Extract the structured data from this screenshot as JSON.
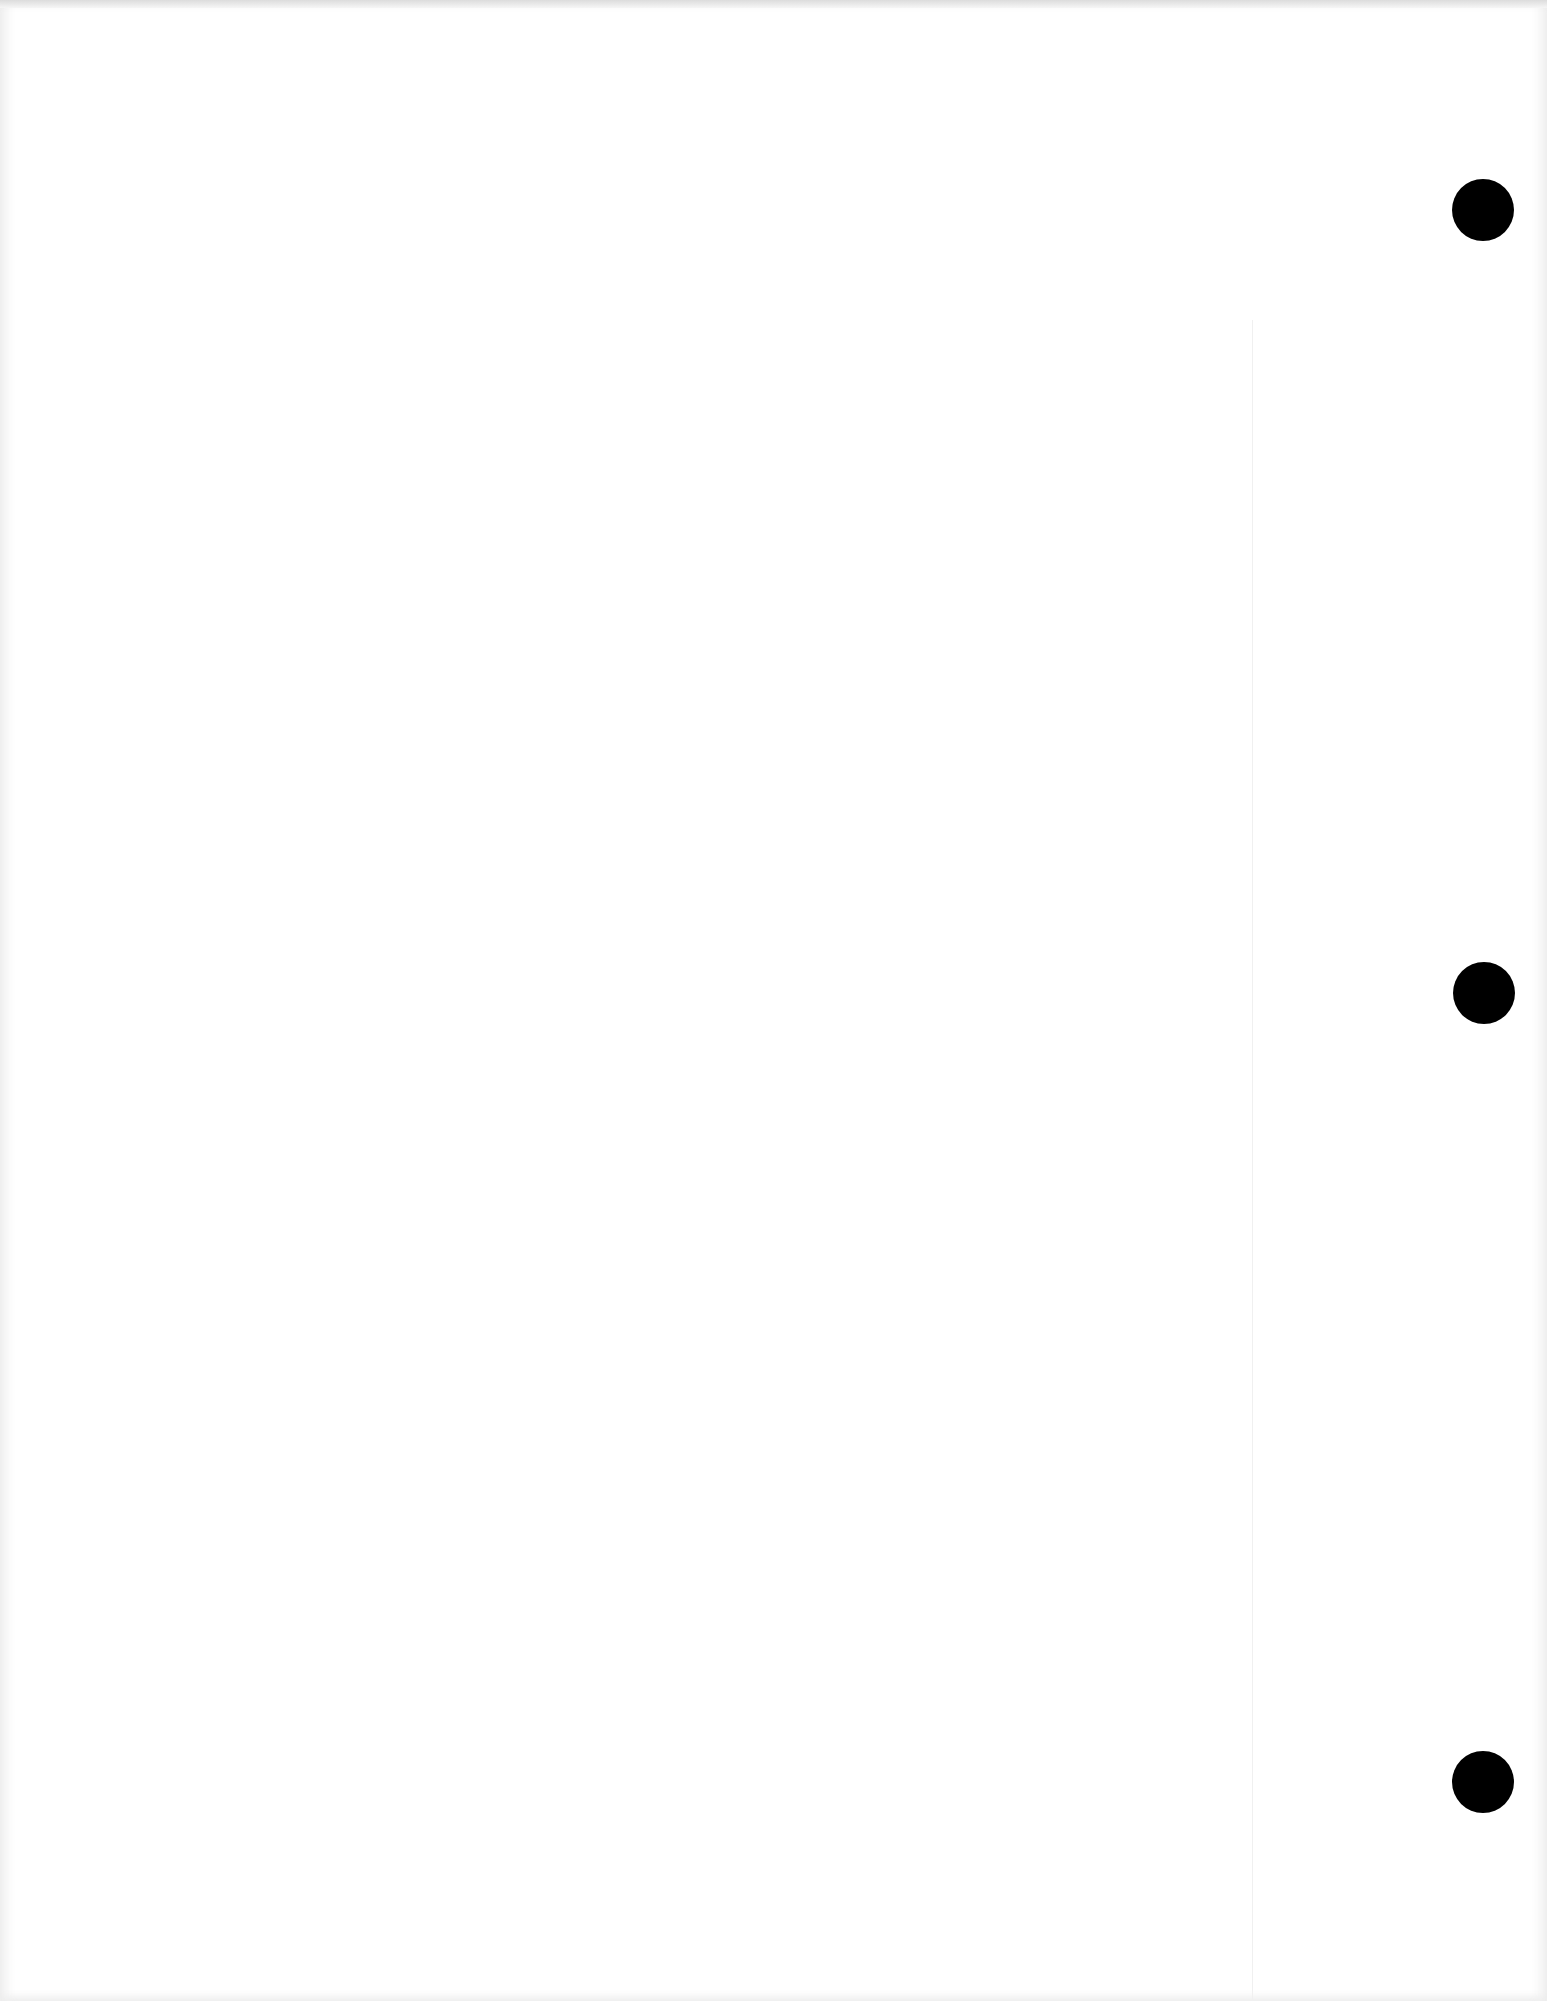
{
  "document": {
    "type": "blank scanned page",
    "text": "",
    "punch_holes": [
      {
        "cx": 1483,
        "cy": 210,
        "r": 31
      },
      {
        "cx": 1484,
        "cy": 993,
        "r": 31
      },
      {
        "cx": 1483,
        "cy": 1782,
        "r": 31
      }
    ],
    "colors": {
      "paper": "#ffffff",
      "hole": "#000000",
      "edge": "#e6e6e6"
    }
  }
}
